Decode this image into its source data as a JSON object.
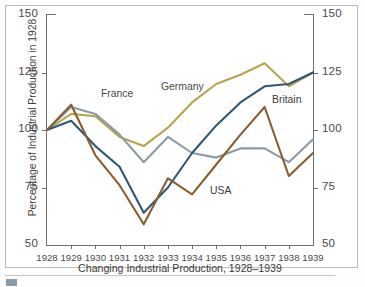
{
  "chart_data": {
    "type": "line",
    "title": "Changing Industrial Production, 1928–1939",
    "xlabel": "",
    "ylabel": "Percentage of Industrial Production in 1928",
    "x": [
      1928,
      1929,
      1930,
      1931,
      1932,
      1933,
      1934,
      1935,
      1936,
      1937,
      1938,
      1939
    ],
    "xlim": [
      1928,
      1939
    ],
    "ylim": [
      50,
      150
    ],
    "yticks": [
      50,
      75,
      100,
      125,
      150
    ],
    "xticks": [
      "1928",
      "1929",
      "1930",
      "1931",
      "1932",
      "1933",
      "1934",
      "1935",
      "1936",
      "1937",
      "1938",
      "1939"
    ],
    "grid": false,
    "legend": "inline-labels",
    "dual_y_axis": true,
    "series": [
      {
        "name": "Germany",
        "color": "#b8a44e",
        "values": [
          100,
          107,
          106,
          97,
          93,
          101,
          112,
          120,
          124,
          129,
          119,
          125
        ]
      },
      {
        "name": "France",
        "color": "#8a9aa6",
        "values": [
          100,
          110,
          107,
          98,
          86,
          97,
          90,
          88,
          92,
          92,
          86,
          96
        ]
      },
      {
        "name": "Britain",
        "color": "#2f5878",
        "values": [
          100,
          104,
          93,
          84,
          64,
          75,
          90,
          102,
          112,
          119,
          120,
          125
        ]
      },
      {
        "name": "USA",
        "color": "#8a5d2e",
        "values": [
          100,
          111,
          89,
          76,
          59,
          79,
          72,
          85,
          98,
          110,
          80,
          90
        ]
      }
    ],
    "series_labels": [
      {
        "name": "France",
        "x": 101,
        "y": 88
      },
      {
        "name": "Germany",
        "x": 161,
        "y": 81
      },
      {
        "name": "Britain",
        "x": 272,
        "y": 94
      },
      {
        "name": "USA",
        "x": 210,
        "y": 185
      }
    ]
  },
  "axes": {
    "left_ticks": [
      "150",
      "125",
      "100",
      "75",
      "50"
    ],
    "right_ticks": [
      "150",
      "125",
      "100",
      "75",
      "50"
    ]
  }
}
